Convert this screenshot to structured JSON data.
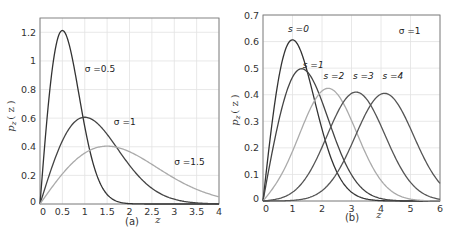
{
  "chart_data": [
    {
      "type": "line",
      "panel_label": "(a)",
      "title": "",
      "xlabel": "z",
      "ylabel": "p_z ( z )",
      "xlim": [
        0,
        4
      ],
      "ylim": [
        0,
        1.3
      ],
      "xticks": [
        "0",
        "0.5",
        "1",
        "1.5",
        "2",
        "2.5",
        "3",
        "3.5",
        "4"
      ],
      "xtick_values": [
        0,
        0.5,
        1,
        1.5,
        2,
        2.5,
        3,
        3.5,
        4
      ],
      "yticks": [
        "0",
        "0.2",
        "0.4",
        "0.6",
        "0.8",
        "1",
        "1.2"
      ],
      "ytick_values": [
        0,
        0.2,
        0.4,
        0.6,
        0.8,
        1.0,
        1.2
      ],
      "grid": true,
      "x": [
        0,
        0.25,
        0.5,
        0.75,
        1.0,
        1.25,
        1.5,
        1.75,
        2.0,
        2.5,
        3.0,
        3.5,
        4.0
      ],
      "series": [
        {
          "name": "σ =0.5",
          "color": "#333333",
          "sigma": 0.5,
          "values": [
            0,
            0.88,
            1.21,
            0.97,
            0.54,
            0.22,
            0.07,
            0.02,
            0.003,
            0,
            0,
            0,
            0
          ]
        },
        {
          "name": "σ =1",
          "color": "#444444",
          "sigma": 1.0,
          "values": [
            0,
            0.24,
            0.44,
            0.57,
            0.61,
            0.57,
            0.49,
            0.38,
            0.27,
            0.11,
            0.03,
            0.01,
            0.001
          ]
        },
        {
          "name": "σ =1.5",
          "color": "#aaaaaa",
          "sigma": 1.5,
          "values": [
            0,
            0.11,
            0.21,
            0.29,
            0.36,
            0.39,
            0.4,
            0.39,
            0.36,
            0.28,
            0.18,
            0.11,
            0.05
          ]
        }
      ],
      "annotations": [
        {
          "text": "σ =0.5",
          "x": 1.0,
          "y": 0.92
        },
        {
          "text": "σ =1",
          "x": 1.65,
          "y": 0.55
        },
        {
          "text": "σ =1.5",
          "x": 3.0,
          "y": 0.27
        }
      ]
    },
    {
      "type": "line",
      "panel_label": "(b)",
      "title": "",
      "xlabel": "z",
      "ylabel": "p_z ( z )",
      "xlim": [
        0,
        6
      ],
      "ylim": [
        0,
        0.7
      ],
      "xticks": [
        "0",
        "1",
        "2",
        "3",
        "4",
        "5",
        "6"
      ],
      "xtick_values": [
        0,
        1,
        2,
        3,
        4,
        5,
        6
      ],
      "yticks": [
        "0",
        "0.1",
        "0.2",
        "0.3",
        "0.4",
        "0.5",
        "0.6",
        "0.7"
      ],
      "ytick_values": [
        0,
        0.1,
        0.2,
        0.3,
        0.4,
        0.5,
        0.6,
        0.7
      ],
      "grid": true,
      "sigma": 1,
      "x": [
        0,
        0.5,
        1,
        1.5,
        2,
        2.5,
        3,
        3.5,
        4,
        4.5,
        5,
        5.5,
        6
      ],
      "series": [
        {
          "name": "s =0",
          "color": "#333333",
          "s": 0,
          "values": [
            0,
            0.44,
            0.61,
            0.49,
            0.27,
            0.11,
            0.03,
            0.01,
            0,
            0,
            0,
            0,
            0
          ]
        },
        {
          "name": "s =1",
          "color": "#444444",
          "s": 1,
          "values": [
            0,
            0.28,
            0.47,
            0.48,
            0.37,
            0.22,
            0.1,
            0.04,
            0.01,
            0,
            0,
            0,
            0
          ]
        },
        {
          "name": "s =2",
          "color": "#aaaaaa",
          "s": 2,
          "values": [
            0,
            0.09,
            0.26,
            0.39,
            0.42,
            0.36,
            0.24,
            0.13,
            0.06,
            0.02,
            0.01,
            0,
            0
          ]
        },
        {
          "name": "s =3",
          "color": "#555555",
          "s": 3,
          "values": [
            0,
            0.02,
            0.08,
            0.2,
            0.33,
            0.4,
            0.41,
            0.34,
            0.23,
            0.13,
            0.06,
            0.02,
            0.01
          ]
        },
        {
          "name": "s =4",
          "color": "#555555",
          "s": 4,
          "values": [
            0,
            0.003,
            0.02,
            0.07,
            0.16,
            0.28,
            0.37,
            0.41,
            0.4,
            0.33,
            0.22,
            0.13,
            0.07
          ]
        }
      ],
      "annotations": [
        {
          "text": "s =0",
          "x": 0.85,
          "y": 0.635
        },
        {
          "text": "s =1",
          "x": 1.35,
          "y": 0.5
        },
        {
          "text": "s =2",
          "x": 2.05,
          "y": 0.46
        },
        {
          "text": "s =3",
          "x": 3.05,
          "y": 0.46
        },
        {
          "text": "s =4",
          "x": 4.05,
          "y": 0.46
        },
        {
          "text": "σ =1",
          "x": 4.6,
          "y": 0.63
        }
      ]
    }
  ],
  "panels": {
    "a": {
      "caption": "(a)",
      "xlabel": "z",
      "ylabel": "p",
      "ylabel_sub": "z",
      "ylabel_paren": "( z )"
    },
    "b": {
      "caption": "(b)",
      "xlabel": "z",
      "ylabel": "p",
      "ylabel_sub": "z",
      "ylabel_paren": "( z )"
    }
  }
}
